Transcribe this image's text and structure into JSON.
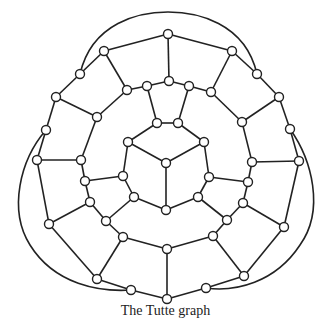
{
  "diagram": {
    "type": "graph",
    "caption": "The Tutte graph",
    "colors": {
      "stroke": "#222222",
      "node_fill": "#ffffff",
      "background": "#ffffff"
    },
    "node_radius": 4.5,
    "nodes": {
      "A": [
        168,
        34
      ],
      "B": [
        232,
        51
      ],
      "C": [
        257,
        74
      ],
      "D": [
        279,
        97
      ],
      "E": [
        290,
        129
      ],
      "F": [
        299,
        161
      ],
      "G": [
        284,
        227
      ],
      "H": [
        244,
        276
      ],
      "I": [
        206,
        288
      ],
      "J": [
        167,
        299
      ],
      "K": [
        131,
        290
      ],
      "L": [
        97,
        279
      ],
      "M": [
        49,
        224
      ],
      "N": [
        37,
        160
      ],
      "O": [
        46,
        130
      ],
      "P": [
        56,
        97
      ],
      "Q": [
        80,
        74
      ],
      "R": [
        104,
        51
      ],
      "S": [
        169,
        81
      ],
      "T": [
        189,
        86
      ],
      "U": [
        211,
        92
      ],
      "V": [
        242,
        122
      ],
      "W": [
        252,
        162
      ],
      "X": [
        248,
        182
      ],
      "Y": [
        243,
        203
      ],
      "Y2": [
        227,
        220
      ],
      "Z": [
        213,
        236
      ],
      "AA": [
        167,
        249
      ],
      "AB": [
        123,
        237
      ],
      "AB2": [
        106,
        221
      ],
      "AC": [
        90,
        202
      ],
      "AD": [
        85,
        181
      ],
      "AE": [
        81,
        160
      ],
      "AF": [
        97,
        117
      ],
      "AG": [
        127,
        90
      ],
      "AH": [
        147,
        86
      ],
      "IT1": [
        157,
        123
      ],
      "IT2": [
        178,
        123
      ],
      "C1": [
        128,
        142
      ],
      "C2": [
        204,
        142
      ],
      "CC": [
        166,
        163
      ],
      "CL": [
        123,
        176
      ],
      "CR": [
        209,
        177
      ],
      "CLL": [
        134,
        197
      ],
      "CRL": [
        198,
        197
      ],
      "CB": [
        166,
        210
      ]
    },
    "edges": [
      [
        "A",
        "B"
      ],
      [
        "B",
        "C"
      ],
      [
        "C",
        "D"
      ],
      [
        "D",
        "E"
      ],
      [
        "E",
        "F"
      ],
      [
        "F",
        "G"
      ],
      [
        "G",
        "H"
      ],
      [
        "H",
        "I"
      ],
      [
        "I",
        "J"
      ],
      [
        "J",
        "K"
      ],
      [
        "K",
        "L"
      ],
      [
        "L",
        "M"
      ],
      [
        "M",
        "N"
      ],
      [
        "N",
        "O"
      ],
      [
        "O",
        "P"
      ],
      [
        "P",
        "Q"
      ],
      [
        "Q",
        "R"
      ],
      [
        "R",
        "A"
      ],
      [
        "A",
        "S"
      ],
      [
        "B",
        "U"
      ],
      [
        "D",
        "V"
      ],
      [
        "F",
        "W"
      ],
      [
        "G",
        "Y"
      ],
      [
        "H",
        "Z"
      ],
      [
        "J",
        "AA"
      ],
      [
        "L",
        "AB"
      ],
      [
        "M",
        "AC"
      ],
      [
        "N",
        "AE"
      ],
      [
        "P",
        "AF"
      ],
      [
        "R",
        "AG"
      ],
      [
        "S",
        "T"
      ],
      [
        "T",
        "U"
      ],
      [
        "U",
        "V"
      ],
      [
        "V",
        "W"
      ],
      [
        "W",
        "X"
      ],
      [
        "X",
        "Y"
      ],
      [
        "Y",
        "Y2"
      ],
      [
        "Y2",
        "Z"
      ],
      [
        "Z",
        "AA"
      ],
      [
        "AA",
        "AB"
      ],
      [
        "AB",
        "AB2"
      ],
      [
        "AB2",
        "AC"
      ],
      [
        "AC",
        "AD"
      ],
      [
        "AD",
        "AE"
      ],
      [
        "AE",
        "AF"
      ],
      [
        "AF",
        "AG"
      ],
      [
        "AG",
        "AH"
      ],
      [
        "AH",
        "S"
      ],
      [
        "AH",
        "IT1"
      ],
      [
        "T",
        "IT2"
      ],
      [
        "IT1",
        "IT2"
      ],
      [
        "IT1",
        "C1"
      ],
      [
        "IT2",
        "C2"
      ],
      [
        "C1",
        "CC"
      ],
      [
        "C2",
        "CC"
      ],
      [
        "CC",
        "CB"
      ],
      [
        "C1",
        "CL"
      ],
      [
        "CL",
        "CLL"
      ],
      [
        "CLL",
        "CB"
      ],
      [
        "C2",
        "CR"
      ],
      [
        "CR",
        "CRL"
      ],
      [
        "CRL",
        "CB"
      ],
      [
        "CL",
        "AD"
      ],
      [
        "CR",
        "X"
      ],
      [
        "CLL",
        "AB2"
      ],
      [
        "CRL",
        "Y2"
      ]
    ],
    "arcs": [
      {
        "from": "Q",
        "to": "C",
        "path": "M80,74 C92,22 140,12 168,12 C196,12 245,22 257,74"
      },
      {
        "from": "O",
        "to": "K",
        "path": "M46,130 C20,160 8,210 30,245 C55,285 100,292 131,290"
      },
      {
        "from": "E",
        "to": "I",
        "path": "M290,129 C312,160 325,210 300,245 C275,283 235,292 206,288"
      }
    ]
  }
}
